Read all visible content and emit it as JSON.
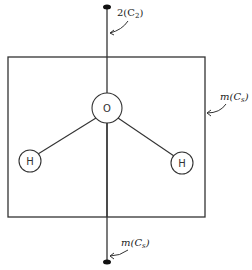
{
  "diagram": {
    "atoms": [
      {
        "label": "O",
        "cx": 107,
        "cy": 108,
        "r": 15
      },
      {
        "label": "H",
        "cx": 30,
        "cy": 161,
        "r": 11
      },
      {
        "label": "H",
        "cx": 182,
        "cy": 163,
        "r": 11
      }
    ],
    "labels": {
      "c2_axis": "2(C",
      "c2_sub": "2",
      "c2_close": ")",
      "mirror_plane_right": "m(C",
      "mirror_plane_right_sub": "s",
      "mirror_plane_right_close": ")",
      "mirror_plane_bottom": "m(C",
      "mirror_plane_bottom_sub": "s",
      "mirror_plane_bottom_close": ")"
    },
    "colors": {
      "line": "#333333",
      "background": "#ffffff"
    }
  }
}
